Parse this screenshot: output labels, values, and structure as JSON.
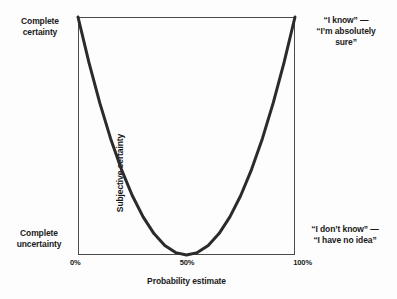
{
  "chart_data": {
    "type": "line",
    "title": "",
    "xlabel": "Probability estimate",
    "ylabel": "Subjective certainty",
    "xticks": [
      "0%",
      "50%",
      "100%"
    ],
    "xtick_values": [
      0,
      50,
      100
    ],
    "xlim": [
      0,
      100
    ],
    "ylim": [
      0,
      1
    ],
    "grid": false,
    "legend": null,
    "y_axis_endpoints": {
      "top": "Complete certainty",
      "bottom": "Complete uncertainty"
    },
    "annotations": [
      {
        "name": "top-right",
        "line1": "“I know” —",
        "line2": "“I’m absolutely",
        "line3": "sure”",
        "text": "“I know” — “I’m absolutely sure”",
        "x": 100,
        "y": 1
      },
      {
        "name": "bottom-right",
        "line1": "“I don’t know” —",
        "line2": "“I have no idea”",
        "text": "“I don’t know” — “I have no idea”",
        "x": 100,
        "y": 0
      }
    ],
    "series": [
      {
        "name": "Subjective certainty vs probability estimate",
        "shape": "U-shaped parabola (symmetric, minimum at 50%)",
        "x": [
          0,
          5,
          10,
          15,
          20,
          25,
          30,
          35,
          40,
          45,
          50,
          55,
          60,
          65,
          70,
          75,
          80,
          85,
          90,
          95,
          100
        ],
        "values": [
          1.0,
          0.81,
          0.64,
          0.49,
          0.36,
          0.25,
          0.16,
          0.09,
          0.04,
          0.01,
          0.0,
          0.01,
          0.04,
          0.09,
          0.16,
          0.25,
          0.36,
          0.49,
          0.64,
          0.81,
          1.0
        ]
      }
    ]
  },
  "colors": {
    "background": "#fdfdfd",
    "curve": "#2b2b2b",
    "frame": "#4a4a4a",
    "text": "#1a1a1a"
  },
  "labels": {
    "complete_certainty": "Complete\ncertainty",
    "complete_certainty_line1": "Complete",
    "complete_certainty_line2": "certainty",
    "complete_uncertainty_line1": "Complete",
    "complete_uncertainty_line2": "uncertainty",
    "ylabel": "Subjective certainty",
    "xlabel": "Probability estimate",
    "tick_0": "0%",
    "tick_50": "50%",
    "tick_100": "100%"
  }
}
